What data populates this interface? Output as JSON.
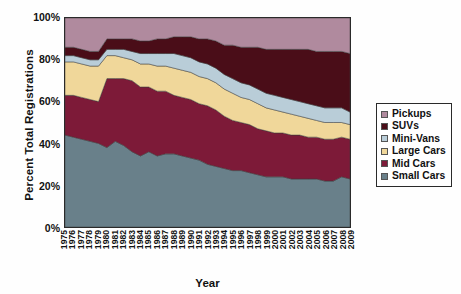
{
  "chart_data": {
    "type": "area",
    "stacked": true,
    "title": "",
    "xlabel": "Year",
    "ylabel": "Percent Total Registrations",
    "ylim": [
      0,
      100
    ],
    "ytick_labels": [
      "0%",
      "20%",
      "40%",
      "60%",
      "80%",
      "100%"
    ],
    "ytick_values": [
      0,
      20,
      40,
      60,
      80,
      100
    ],
    "grid": false,
    "legend_position": "right",
    "x": [
      1975,
      1976,
      1977,
      1978,
      1979,
      1980,
      1981,
      1982,
      1983,
      1984,
      1985,
      1986,
      1987,
      1988,
      1989,
      1990,
      1991,
      1992,
      1993,
      1994,
      1995,
      1996,
      1997,
      1998,
      1999,
      2000,
      2001,
      2002,
      2003,
      2004,
      2005,
      2006,
      2007,
      2008,
      2009
    ],
    "categories": [
      "1975",
      "1976",
      "1977",
      "1978",
      "1979",
      "1980",
      "1981",
      "1982",
      "1983",
      "1984",
      "1985",
      "1986",
      "1987",
      "1988",
      "1989",
      "1990",
      "1991",
      "1992",
      "1993",
      "1994",
      "1995",
      "1996",
      "1997",
      "1998",
      "1999",
      "2000",
      "2001",
      "2002",
      "2003",
      "2004",
      "2005",
      "2006",
      "2007",
      "2008",
      "2009"
    ],
    "series": [
      {
        "name": "Small Cars",
        "color": "#69808a",
        "values": [
          44,
          43,
          42,
          41,
          40,
          38,
          41,
          39,
          36,
          34,
          36,
          34,
          35,
          35,
          34,
          33,
          32,
          30,
          29,
          28,
          27,
          27,
          26,
          25,
          24,
          24,
          24,
          23,
          23,
          23,
          23,
          22,
          22,
          24,
          23
        ]
      },
      {
        "name": "Mid Cars",
        "color": "#7d1a38",
        "values": [
          19,
          20,
          20,
          20,
          20,
          33,
          30,
          32,
          34,
          33,
          31,
          31,
          30,
          28,
          28,
          28,
          27,
          28,
          27,
          25,
          24,
          23,
          23,
          22,
          22,
          21,
          21,
          21,
          21,
          20,
          20,
          20,
          20,
          19,
          19
        ]
      },
      {
        "name": "Large Cars",
        "color": "#f0d79a",
        "values": [
          16,
          16,
          16,
          16,
          17,
          11,
          11,
          10,
          10,
          11,
          11,
          12,
          12,
          13,
          13,
          13,
          13,
          13,
          13,
          13,
          13,
          12,
          12,
          12,
          11,
          11,
          10,
          10,
          9,
          9,
          8,
          8,
          8,
          7,
          7
        ]
      },
      {
        "name": "Mini-Vans",
        "color": "#b9cdd8",
        "values": [
          3,
          3,
          3,
          3,
          3,
          3,
          3,
          4,
          4,
          5,
          5,
          6,
          6,
          7,
          7,
          7,
          7,
          7,
          7,
          7,
          7,
          7,
          7,
          7,
          7,
          7,
          7,
          7,
          7,
          7,
          7,
          7,
          7,
          7,
          6
        ]
      },
      {
        "name": "SUVs",
        "color": "#4a0d18",
        "values": [
          4,
          4,
          4,
          4,
          4,
          5,
          5,
          5,
          6,
          6,
          6,
          7,
          7,
          8,
          9,
          10,
          11,
          12,
          13,
          14,
          16,
          17,
          18,
          20,
          21,
          22,
          23,
          24,
          25,
          26,
          26,
          27,
          27,
          27,
          28
        ]
      },
      {
        "name": "Pickups",
        "color": "#b08a9e",
        "values": [
          14,
          14,
          15,
          16,
          16,
          10,
          10,
          10,
          10,
          11,
          11,
          10,
          10,
          9,
          9,
          9,
          10,
          10,
          11,
          13,
          13,
          14,
          14,
          14,
          15,
          15,
          15,
          15,
          15,
          15,
          16,
          16,
          16,
          16,
          17
        ]
      }
    ]
  },
  "legend": {
    "items": [
      {
        "label": "Pickups",
        "color": "#b08a9e"
      },
      {
        "label": "SUVs",
        "color": "#4a0d18"
      },
      {
        "label": "Mini-Vans",
        "color": "#b9cdd8"
      },
      {
        "label": "Large Cars",
        "color": "#f0d79a"
      },
      {
        "label": "Mid Cars",
        "color": "#7d1a38"
      },
      {
        "label": "Small Cars",
        "color": "#69808a"
      }
    ]
  }
}
